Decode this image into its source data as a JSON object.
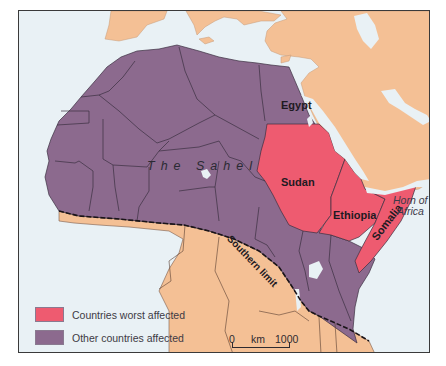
{
  "map": {
    "region": "Africa",
    "labels": {
      "egypt": "Egypt",
      "sudan": "Sudan",
      "ethiopia": "Ethiopia",
      "somalia": "Somalia",
      "sahel": "The Sahel",
      "horn_line1": "Horn of",
      "horn_line2": "Africa",
      "southern_limit": "Southern limit"
    },
    "colors": {
      "worst": "#ee5b70",
      "other": "#8c6a8e",
      "unaffected_land": "#f4c095",
      "sea": "#e9f1f5",
      "border": "#3b2f40"
    },
    "legend": [
      {
        "label": "Countries worst affected",
        "color": "#ee5b70"
      },
      {
        "label": "Other countries affected",
        "color": "#8c6a8e"
      }
    ],
    "scale": {
      "start": "0",
      "unit": "km",
      "end": "1000"
    }
  }
}
